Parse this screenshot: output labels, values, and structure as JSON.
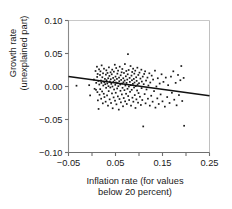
{
  "chart_data": {
    "type": "scatter",
    "title": "",
    "xlabel": "Inflation rate (for values below 20 percent)",
    "xlabel_lines": [
      "Inflation rate (for values",
      "below 20 percent)"
    ],
    "ylabel": "Growth rate (unexplained part)",
    "ylabel_lines": [
      "Growth rate",
      "(unexplained part)"
    ],
    "xlim": [
      -0.05,
      0.25
    ],
    "ylim": [
      -0.1,
      0.1
    ],
    "xticks": [
      -0.05,
      0.05,
      0.15,
      0.25
    ],
    "xticklabels": [
      "−0.05",
      "0.05",
      "0.15",
      "0.25"
    ],
    "x_minor_ticks": [
      0.0,
      0.1,
      0.2
    ],
    "yticks": [
      0.1,
      0.05,
      0.0,
      -0.05,
      -0.1
    ],
    "yticklabels": [
      "0.10",
      "0.05",
      "0.00",
      "−0.05",
      "−0.10"
    ],
    "grid": false,
    "legend": null,
    "marker": {
      "shape": "square",
      "size": 1.7,
      "color": "#1a1a1a"
    },
    "trendline": {
      "type": "linear",
      "color": "#111111",
      "width": 1.6,
      "x": [
        -0.05,
        0.25
      ],
      "y": [
        0.0152,
        -0.0141
      ],
      "slope": -0.0977,
      "intercept": 0.0103
    },
    "axis_colors": {
      "left_spine": "#8a8a8a",
      "bottom_spine": "#6f6f6f",
      "top_spine": "#c8c8c8",
      "right_spine": "#c0c0c0",
      "tick": "#6f6f6f"
    },
    "points": [
      [
        -0.033,
        0.0012
      ],
      [
        -0.006,
        0.002
      ],
      [
        -0.004,
        -0.0135
      ],
      [
        0.004,
        0.0105
      ],
      [
        0.0055,
        -0.0035
      ],
      [
        0.0075,
        0.0235
      ],
      [
        0.0085,
        -0.005
      ],
      [
        0.009,
        0.0055
      ],
      [
        0.0105,
        0.03
      ],
      [
        0.011,
        0.0145
      ],
      [
        0.0115,
        -0.0085
      ],
      [
        0.012,
        0.019
      ],
      [
        0.0125,
        -0.021
      ],
      [
        0.0135,
        0.0085
      ],
      [
        0.014,
        -0.034
      ],
      [
        0.015,
        0.026
      ],
      [
        0.0155,
        0.003
      ],
      [
        0.016,
        -0.0125
      ],
      [
        0.017,
        0.0175
      ],
      [
        0.0175,
        -0.004
      ],
      [
        0.018,
        0.023
      ],
      [
        0.019,
        0.009
      ],
      [
        0.0195,
        -0.0185
      ],
      [
        0.02,
        0.0055
      ],
      [
        0.0205,
        0.032
      ],
      [
        0.0215,
        -0.0075
      ],
      [
        0.022,
        0.014
      ],
      [
        0.023,
        -0.0255
      ],
      [
        0.0235,
        0.02
      ],
      [
        0.024,
        0.0015
      ],
      [
        0.025,
        -0.011
      ],
      [
        0.0255,
        0.027
      ],
      [
        0.026,
        0.0065
      ],
      [
        0.0265,
        -0.016
      ],
      [
        0.0275,
        0.0115
      ],
      [
        0.028,
        0.0035
      ],
      [
        0.029,
        -0.023
      ],
      [
        0.0295,
        0.018
      ],
      [
        0.03,
        -0.002
      ],
      [
        0.0305,
        0.0245
      ],
      [
        0.031,
        0.0095
      ],
      [
        0.032,
        -0.0135
      ],
      [
        0.0325,
        0.0045
      ],
      [
        0.033,
        0.0205
      ],
      [
        0.034,
        -0.029
      ],
      [
        0.0345,
        0.0125
      ],
      [
        0.035,
        0.0005
      ],
      [
        0.0355,
        -0.007
      ],
      [
        0.036,
        0.029
      ],
      [
        0.037,
        0.016
      ],
      [
        0.0375,
        -0.0195
      ],
      [
        0.038,
        0.0075
      ],
      [
        0.039,
        -0.0015
      ],
      [
        0.0395,
        0.0215
      ],
      [
        0.04,
        0.011
      ],
      [
        0.0405,
        -0.025
      ],
      [
        0.041,
        0.004
      ],
      [
        0.042,
        0.0185
      ],
      [
        0.0425,
        -0.0105
      ],
      [
        0.043,
        0.0255
      ],
      [
        0.0435,
        0.0
      ],
      [
        0.044,
        -0.033
      ],
      [
        0.045,
        0.013
      ],
      [
        0.0455,
        0.007
      ],
      [
        0.046,
        -0.0165
      ],
      [
        0.0465,
        0.0225
      ],
      [
        0.047,
        -0.0045
      ],
      [
        0.048,
        0.0095
      ],
      [
        0.0485,
        0.033
      ],
      [
        0.049,
        -0.0215
      ],
      [
        0.0495,
        0.0025
      ],
      [
        0.05,
        0.015
      ],
      [
        0.0505,
        -0.0095
      ],
      [
        0.051,
        0.006
      ],
      [
        0.0515,
        0.028
      ],
      [
        0.052,
        -0.027
      ],
      [
        0.053,
        0.0115
      ],
      [
        0.0535,
        -0.003
      ],
      [
        0.054,
        0.0195
      ],
      [
        0.0545,
        0.005
      ],
      [
        0.055,
        -0.015
      ],
      [
        0.0555,
        0.024
      ],
      [
        0.056,
        0.0005
      ],
      [
        0.057,
        -0.035
      ],
      [
        0.0575,
        0.0135
      ],
      [
        0.058,
        0.008
      ],
      [
        0.0585,
        -0.019
      ],
      [
        0.059,
        0.03
      ],
      [
        0.06,
        0.003
      ],
      [
        0.0605,
        -0.0065
      ],
      [
        0.061,
        0.017
      ],
      [
        0.0615,
        -0.024
      ],
      [
        0.062,
        0.01
      ],
      [
        0.063,
        0.0215
      ],
      [
        0.0635,
        -0.012
      ],
      [
        0.064,
        0.0045
      ],
      [
        0.0645,
        0.0265
      ],
      [
        0.065,
        -0.002
      ],
      [
        0.066,
        -0.03
      ],
      [
        0.0665,
        0.0125
      ],
      [
        0.067,
        0.0065
      ],
      [
        0.0675,
        -0.0175
      ],
      [
        0.068,
        0.0205
      ],
      [
        0.069,
        -0.0055
      ],
      [
        0.0695,
        0.009
      ],
      [
        0.07,
        0.034
      ],
      [
        0.0705,
        -0.0225
      ],
      [
        0.071,
        0.0015
      ],
      [
        0.072,
        0.0155
      ],
      [
        0.0725,
        -0.011
      ],
      [
        0.073,
        0.0235
      ],
      [
        0.0735,
        0.0055
      ],
      [
        0.074,
        -0.0265
      ],
      [
        0.075,
        0.0105
      ],
      [
        0.0755,
        -0.0035
      ],
      [
        0.076,
        0.0185
      ],
      [
        0.0765,
        0.049
      ],
      [
        0.077,
        -0.0145
      ],
      [
        0.078,
        0.025
      ],
      [
        0.0785,
        0.0
      ],
      [
        0.079,
        -0.0205
      ],
      [
        0.08,
        0.013
      ],
      [
        0.0805,
        0.007
      ],
      [
        0.081,
        -0.008
      ],
      [
        0.082,
        0.031
      ],
      [
        0.0825,
        0.002
      ],
      [
        0.083,
        -0.029
      ],
      [
        0.084,
        0.0165
      ],
      [
        0.0845,
        -0.005
      ],
      [
        0.085,
        0.0095
      ],
      [
        0.0855,
        0.022
      ],
      [
        0.086,
        -0.017
      ],
      [
        0.087,
        0.004
      ],
      [
        0.0875,
        0.027
      ],
      [
        0.088,
        -0.023
      ],
      [
        0.089,
        0.0115
      ],
      [
        0.0895,
        -0.0015
      ],
      [
        0.09,
        0.0195
      ],
      [
        0.0905,
        0.006
      ],
      [
        0.091,
        -0.013
      ],
      [
        0.092,
        0.024
      ],
      [
        0.0925,
        -0.0325
      ],
      [
        0.093,
        0.0005
      ],
      [
        0.094,
        0.014
      ],
      [
        0.0945,
        -0.0195
      ],
      [
        0.095,
        0.0085
      ],
      [
        0.096,
        -0.006
      ],
      [
        0.0965,
        0.0285
      ],
      [
        0.097,
        0.003
      ],
      [
        0.098,
        -0.0245
      ],
      [
        0.0985,
        0.0175
      ],
      [
        0.099,
        -0.01
      ],
      [
        0.1,
        0.005
      ],
      [
        0.101,
        0.021
      ],
      [
        0.102,
        -0.0155
      ],
      [
        0.103,
        0.012
      ],
      [
        0.104,
        -0.028
      ],
      [
        0.105,
        0.0255
      ],
      [
        0.1055,
        -0.0025
      ],
      [
        0.106,
        0.0075
      ],
      [
        0.107,
        -0.0205
      ],
      [
        0.108,
        0.015
      ],
      [
        0.109,
        -0.0605
      ],
      [
        0.11,
        0.0035
      ],
      [
        0.111,
        0.019
      ],
      [
        0.112,
        -0.0115
      ],
      [
        0.113,
        0.023
      ],
      [
        0.114,
        -0.0255
      ],
      [
        0.115,
        0.009
      ],
      [
        0.116,
        -0.0045
      ],
      [
        0.118,
        0.0135
      ],
      [
        0.119,
        -0.0185
      ],
      [
        0.12,
        0.0015
      ],
      [
        0.122,
        0.02
      ],
      [
        0.123,
        -0.029
      ],
      [
        0.124,
        0.006
      ],
      [
        0.126,
        -0.014
      ],
      [
        0.127,
        0.0165
      ],
      [
        0.129,
        -0.023
      ],
      [
        0.13,
        0.0105
      ],
      [
        0.132,
        -0.007
      ],
      [
        0.134,
        0.024
      ],
      [
        0.135,
        -0.032
      ],
      [
        0.137,
        0.0
      ],
      [
        0.139,
        -0.018
      ],
      [
        0.14,
        0.0125
      ],
      [
        0.142,
        -0.0265
      ],
      [
        0.144,
        0.0045
      ],
      [
        0.146,
        -0.012
      ],
      [
        0.148,
        0.0185
      ],
      [
        0.15,
        -0.0225
      ],
      [
        0.152,
        0.007
      ],
      [
        0.155,
        -0.0305
      ],
      [
        0.157,
        0.0135
      ],
      [
        0.16,
        -0.016
      ],
      [
        0.162,
        0.002
      ],
      [
        0.165,
        -0.025
      ],
      [
        0.168,
        0.015
      ],
      [
        0.17,
        -0.0095
      ],
      [
        0.173,
        0.023
      ],
      [
        0.175,
        -0.02
      ],
      [
        0.178,
        0.0055
      ],
      [
        0.18,
        -0.0285
      ],
      [
        0.183,
        0.0175
      ],
      [
        0.185,
        -0.013
      ],
      [
        0.188,
        0.0095
      ],
      [
        0.19,
        0.031
      ],
      [
        0.192,
        -0.022
      ],
      [
        0.195,
        0.013
      ],
      [
        0.196,
        -0.0595
      ]
    ]
  }
}
